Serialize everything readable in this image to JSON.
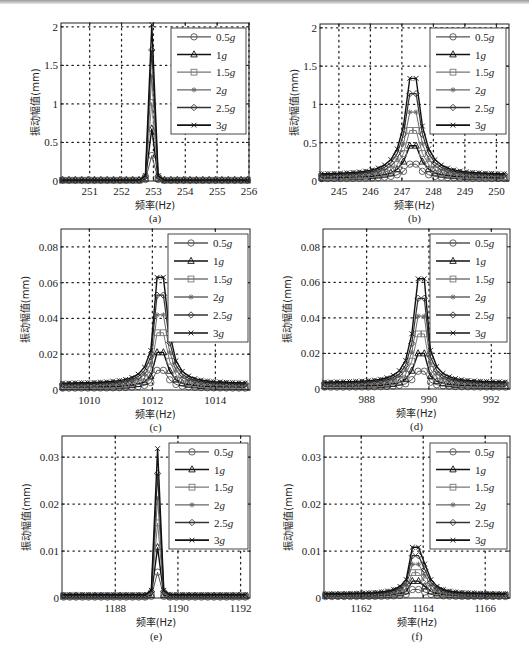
{
  "figure": {
    "series_styles": [
      {
        "name": "0.5g",
        "marker": "circle",
        "color": "#555555",
        "width": 1.0
      },
      {
        "name": "1g",
        "marker": "triangle",
        "color": "#111111",
        "width": 1.4
      },
      {
        "name": "1.5g",
        "marker": "square",
        "color": "#777777",
        "width": 1.0
      },
      {
        "name": "2g",
        "marker": "star",
        "color": "#666666",
        "width": 1.0
      },
      {
        "name": "2.5g",
        "marker": "diamond",
        "color": "#333333",
        "width": 1.2
      },
      {
        "name": "3g",
        "marker": "x",
        "color": "#111111",
        "width": 1.4
      }
    ],
    "legend_labels": [
      {
        "num": "0.5",
        "unit": "g"
      },
      {
        "num": "1",
        "unit": "g"
      },
      {
        "num": "1.5",
        "unit": "g"
      },
      {
        "num": "2",
        "unit": "g"
      },
      {
        "num": "2.5",
        "unit": "g"
      },
      {
        "num": "3",
        "unit": "g"
      }
    ]
  },
  "chart_data": [
    {
      "id": "a",
      "type": "line",
      "caption": "(a)",
      "xlabel": "频率(Hz)",
      "ylabel": "振动幅值(mm)",
      "xlim": [
        250.1,
        256
      ],
      "ylim": [
        0,
        2.05
      ],
      "xticks": [
        251,
        252,
        253,
        254,
        255,
        256
      ],
      "xtick_labels": [
        "251",
        "252",
        "253",
        "254",
        "255",
        "256"
      ],
      "yticks": [
        0,
        0.5,
        1,
        1.5,
        2
      ],
      "ytick_labels": [
        "0",
        "0.5",
        "1",
        "1.5",
        "2"
      ],
      "grid": "dotted",
      "legend_position": "upper right",
      "peak_x": 253.0,
      "halfwidth": 0.15,
      "lorentz": false,
      "baseline": [
        0.01,
        0.01,
        0.01,
        0.01,
        0.01,
        0.01
      ],
      "series": [
        {
          "name": "0.5g",
          "peak": 0.33
        },
        {
          "name": "1g",
          "peak": 0.68
        },
        {
          "name": "1.5g",
          "peak": 1.02
        },
        {
          "name": "2g",
          "peak": 1.36
        },
        {
          "name": "2.5g",
          "peak": 1.7
        },
        {
          "name": "3g",
          "peak": 2.03
        }
      ],
      "box": {
        "x0": 61,
        "y0": 23,
        "x1": 249,
        "y1": 181
      },
      "legend_box": {
        "x0": 171,
        "y0": 28,
        "x1": 246,
        "y1": 134
      }
    },
    {
      "id": "b",
      "type": "line",
      "caption": "(b)",
      "xlabel": "频率(Hz)",
      "ylabel": "振动幅值(mm)",
      "xlim": [
        244.4,
        250.4
      ],
      "ylim": [
        0,
        2.05
      ],
      "xticks": [
        245,
        246,
        247,
        248,
        249,
        250
      ],
      "xtick_labels": [
        "245",
        "246",
        "247",
        "248",
        "249",
        "250"
      ],
      "yticks": [
        0,
        0.5,
        1,
        1.5,
        2
      ],
      "ytick_labels": [
        "0",
        "0.5",
        "1",
        "1.5",
        "2"
      ],
      "grid": "dotted",
      "legend_position": "upper right",
      "peak_x": 247.35,
      "halfwidth": 0.45,
      "lorentz": true,
      "baseline": [
        0.03,
        0.04,
        0.05,
        0.06,
        0.07,
        0.08
      ],
      "series": [
        {
          "name": "0.5g",
          "peak": 0.22
        },
        {
          "name": "1g",
          "peak": 0.46
        },
        {
          "name": "1.5g",
          "peak": 0.66
        },
        {
          "name": "2g",
          "peak": 0.9
        },
        {
          "name": "2.5g",
          "peak": 1.14
        },
        {
          "name": "3g",
          "peak": 1.34
        }
      ],
      "box": {
        "x0": 320,
        "y0": 24,
        "x1": 509,
        "y1": 181
      },
      "legend_box": {
        "x0": 430,
        "y0": 28,
        "x1": 506,
        "y1": 134
      }
    },
    {
      "id": "c",
      "type": "line",
      "caption": "(c)",
      "xlabel": "频率(Hz)",
      "ylabel": "振动幅值(mm)",
      "xlim": [
        1009.1,
        1015.1
      ],
      "ylim": [
        0,
        0.09
      ],
      "xticks": [
        1010,
        1012,
        1014
      ],
      "xtick_labels": [
        "1010",
        "1012",
        "1014"
      ],
      "yticks": [
        0,
        0.02,
        0.04,
        0.06,
        0.08
      ],
      "ytick_labels": [
        "0",
        "0.02",
        "0.04",
        "0.06",
        "0.08"
      ],
      "grid": "dotted",
      "legend_position": "upper right",
      "peak_x": 1012.3,
      "halfwidth": 0.35,
      "lorentz": true,
      "baseline": [
        0.001,
        0.0015,
        0.002,
        0.0025,
        0.003,
        0.0035
      ],
      "series": [
        {
          "name": "0.5g",
          "peak": 0.011
        },
        {
          "name": "1g",
          "peak": 0.021
        },
        {
          "name": "1.5g",
          "peak": 0.032
        },
        {
          "name": "2g",
          "peak": 0.042
        },
        {
          "name": "2.5g",
          "peak": 0.053
        },
        {
          "name": "3g",
          "peak": 0.063
        }
      ],
      "box": {
        "x0": 61,
        "y0": 229,
        "x1": 250,
        "y1": 390
      },
      "legend_box": {
        "x0": 168,
        "y0": 234,
        "x1": 248,
        "y1": 342
      }
    },
    {
      "id": "d",
      "type": "line",
      "caption": "(d)",
      "xlabel": "频率(Hz)",
      "ylabel": "振动幅值(mm)",
      "xlim": [
        986.6,
        992.6
      ],
      "ylim": [
        0,
        0.09
      ],
      "xticks": [
        988,
        990,
        992
      ],
      "xtick_labels": [
        "988",
        "990",
        "992"
      ],
      "yticks": [
        0,
        0.02,
        0.04,
        0.06,
        0.08
      ],
      "ytick_labels": [
        "0",
        "0.02",
        "0.04",
        "0.06",
        "0.08"
      ],
      "grid": "dotted",
      "legend_position": "upper right",
      "peak_x": 989.7,
      "halfwidth": 0.35,
      "lorentz": true,
      "baseline": [
        0.001,
        0.0015,
        0.002,
        0.0025,
        0.003,
        0.0035
      ],
      "series": [
        {
          "name": "0.5g",
          "peak": 0.01
        },
        {
          "name": "1g",
          "peak": 0.02
        },
        {
          "name": "1.5g",
          "peak": 0.031
        },
        {
          "name": "2g",
          "peak": 0.041
        },
        {
          "name": "2.5g",
          "peak": 0.051
        },
        {
          "name": "3g",
          "peak": 0.062
        }
      ],
      "box": {
        "x0": 323,
        "y0": 229,
        "x1": 510,
        "y1": 389
      },
      "legend_box": {
        "x0": 430,
        "y0": 234,
        "x1": 507,
        "y1": 342
      }
    },
    {
      "id": "e",
      "type": "line",
      "caption": "(e)",
      "xlabel": "频率(Hz)",
      "ylabel": "振动幅值(mm)",
      "xlim": [
        1186.3,
        1192.3
      ],
      "ylim": [
        0,
        0.0345
      ],
      "xticks": [
        1188,
        1190,
        1192
      ],
      "xtick_labels": [
        "1188",
        "1190",
        "1192"
      ],
      "yticks": [
        0,
        0.01,
        0.02,
        0.03
      ],
      "ytick_labels": [
        "0",
        "0.01",
        "0.02",
        "0.03"
      ],
      "grid": "dotted",
      "legend_position": "upper right",
      "peak_x": 1189.3,
      "halfwidth": 0.15,
      "lorentz": false,
      "baseline": [
        0.0002,
        0.0003,
        0.0004,
        0.0005,
        0.0006,
        0.0007
      ],
      "series": [
        {
          "name": "0.5g",
          "peak": 0.0055
        },
        {
          "name": "1g",
          "peak": 0.0108
        },
        {
          "name": "1.5g",
          "peak": 0.016
        },
        {
          "name": "2g",
          "peak": 0.0212
        },
        {
          "name": "2.5g",
          "peak": 0.0265
        },
        {
          "name": "3g",
          "peak": 0.0318
        }
      ],
      "box": {
        "x0": 62,
        "y0": 436,
        "x1": 250,
        "y1": 598
      },
      "legend_box": {
        "x0": 169,
        "y0": 443,
        "x1": 248,
        "y1": 549
      }
    },
    {
      "id": "f",
      "type": "line",
      "caption": "(f)",
      "xlabel": "频率(Hz)",
      "ylabel": "振动幅值(mm)",
      "xlim": [
        1160.8,
        1166.8
      ],
      "ylim": [
        0,
        0.0345
      ],
      "xticks": [
        1162,
        1164,
        1166
      ],
      "xtick_labels": [
        "1162",
        "1164",
        "1166"
      ],
      "yticks": [
        0,
        0.01,
        0.02,
        0.03
      ],
      "ytick_labels": [
        "0",
        "0.01",
        "0.02",
        "0.03"
      ],
      "grid": "dotted",
      "legend_position": "upper right",
      "peak_x": 1163.85,
      "halfwidth": 0.4,
      "lorentz": true,
      "baseline": [
        0.0003,
        0.0004,
        0.0005,
        0.0006,
        0.0007,
        0.0008
      ],
      "series": [
        {
          "name": "0.5g",
          "peak": 0.0018
        },
        {
          "name": "1g",
          "peak": 0.0036
        },
        {
          "name": "1.5g",
          "peak": 0.0054
        },
        {
          "name": "2g",
          "peak": 0.0072
        },
        {
          "name": "2.5g",
          "peak": 0.009
        },
        {
          "name": "3g",
          "peak": 0.0108
        }
      ],
      "box": {
        "x0": 324,
        "y0": 436,
        "x1": 510,
        "y1": 598
      },
      "legend_box": {
        "x0": 430,
        "y0": 443,
        "x1": 507,
        "y1": 549
      }
    }
  ]
}
